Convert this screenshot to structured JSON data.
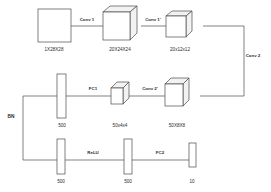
{
  "diagram": {
    "background_color": "#ffffff",
    "stroke_color": "#4a4a4a",
    "text_color": "#2b2b2b",
    "rows": [
      {
        "name": "top-row",
        "nodes": [
          {
            "id": "input",
            "label": "1X28X28",
            "shape": "square"
          },
          {
            "id": "conv1-out",
            "label": "20X24X24",
            "shape": "cube"
          },
          {
            "id": "pool1-out",
            "label": "20x12x12",
            "shape": "cube"
          }
        ],
        "edges": [
          {
            "id": "conv1",
            "label": "Conv 1"
          },
          {
            "id": "conv1p",
            "label": "Conv 1'"
          }
        ]
      },
      {
        "name": "middle-row",
        "nodes": [
          {
            "id": "fc1-in",
            "label": "500",
            "shape": "bar"
          },
          {
            "id": "conv2p-in",
            "label": "50x4x4",
            "shape": "cube"
          },
          {
            "id": "conv2-out",
            "label": "50X8X8",
            "shape": "cube"
          }
        ],
        "edges": [
          {
            "id": "fc1",
            "label": "FC1"
          },
          {
            "id": "conv2p",
            "label": "Conv 2'"
          }
        ]
      },
      {
        "name": "bottom-row",
        "nodes": [
          {
            "id": "bn-out",
            "label": "500",
            "shape": "bar"
          },
          {
            "id": "relu-out",
            "label": "500",
            "shape": "bar"
          },
          {
            "id": "output",
            "label": "10",
            "shape": "bar"
          }
        ],
        "edges": [
          {
            "id": "relu",
            "label": "ReLU"
          },
          {
            "id": "fc2",
            "label": "FC2"
          }
        ]
      }
    ],
    "side_edges": [
      {
        "id": "conv2",
        "label": "Conv 2"
      },
      {
        "id": "bn",
        "label": "BN"
      }
    ],
    "labels": {
      "input": "1X28X28",
      "conv1_out": "20X24X24",
      "pool1_out": "20x12x12",
      "conv2_out": "50X8X8",
      "conv2p_in": "50x4x4",
      "fc1_in": "500",
      "bn_out": "500",
      "relu_out": "500",
      "output": "10",
      "edge_conv1": "Conv 1",
      "edge_conv1p": "Conv 1'",
      "edge_conv2": "Conv 2",
      "edge_conv2p": "Conv 2'",
      "edge_fc1": "FC1",
      "edge_fc2": "FC2",
      "edge_relu": "ReLU",
      "edge_bn": "BN"
    }
  }
}
